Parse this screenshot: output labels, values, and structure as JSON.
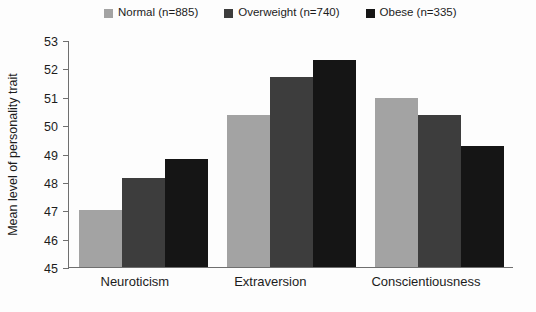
{
  "chart_data": {
    "type": "bar",
    "title": "",
    "xlabel": "",
    "ylabel": "Mean level of personality trait",
    "ylim": [
      45,
      53
    ],
    "yticks": [
      53,
      52,
      51,
      50,
      49,
      48,
      47,
      46,
      45
    ],
    "grid": false,
    "legend_position": "top",
    "categories": [
      "Neuroticism",
      "Extraversion",
      "Conscientiousness"
    ],
    "series": [
      {
        "name": "Normal (n=885)",
        "color": "#a3a3a3",
        "values": [
          47.0,
          50.35,
          50.95
        ]
      },
      {
        "name": "Overweight (n=740)",
        "color": "#3d3d3d",
        "values": [
          48.15,
          51.7,
          50.35
        ]
      },
      {
        "name": "Obese (n=335)",
        "color": "#151515",
        "values": [
          48.8,
          52.3,
          49.25
        ]
      }
    ]
  }
}
